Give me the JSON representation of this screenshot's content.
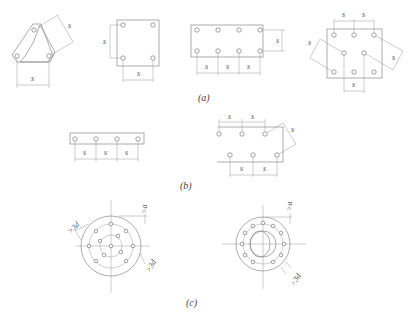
{
  "figure": {
    "captions": {
      "a": "(a)",
      "b": "(b)",
      "c": "(c)"
    },
    "labels": {
      "spacing": "s",
      "edge_distance": ">a",
      "diameter_clearance": ">3d"
    },
    "panels": [
      {
        "id": "a1",
        "group": "a",
        "description": "triangular plate with 3 bolts",
        "bolt_count": 3
      },
      {
        "id": "a2",
        "group": "a",
        "description": "square plate with 4 bolts",
        "bolt_count": 4
      },
      {
        "id": "a3",
        "group": "a",
        "description": "rectangular plate with 2 rows of 4 bolts",
        "bolt_count": 8
      },
      {
        "id": "a4",
        "group": "a",
        "description": "staggered plate with 8 bolts",
        "bolt_count": 8
      },
      {
        "id": "b1",
        "group": "b",
        "description": "single row of 4 bolts",
        "bolt_count": 4
      },
      {
        "id": "b2",
        "group": "b",
        "description": "staggered two rows of 3 bolts",
        "bolt_count": 6
      },
      {
        "id": "c1",
        "group": "c",
        "description": "circular flange with two concentric bolt rings",
        "bolt_count": 13
      },
      {
        "id": "c2",
        "group": "c",
        "description": "circular flange with single bolt ring",
        "bolt_count": 12
      }
    ]
  }
}
